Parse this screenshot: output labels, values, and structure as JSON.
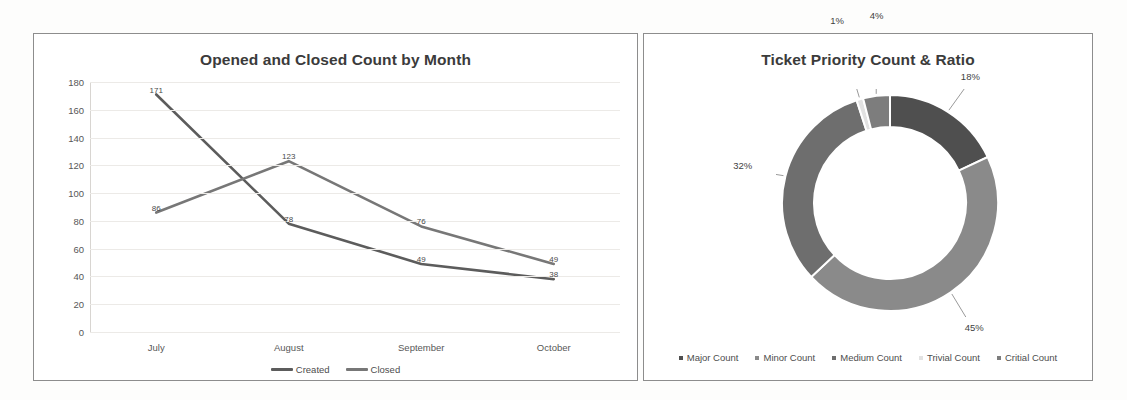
{
  "page": {
    "background": "#fdfdfc"
  },
  "line_panel": {
    "title": "Opened and Closed Count by Month",
    "legend": [
      {
        "label": "Created",
        "color": "#5c5c5c"
      },
      {
        "label": "Closed",
        "color": "#777777"
      }
    ]
  },
  "donut_panel": {
    "title": "Ticket Priority Count & Ratio",
    "legend": [
      {
        "label": "Major Count",
        "color": "#4f4f4f"
      },
      {
        "label": "Minor Count",
        "color": "#8a8a8a"
      },
      {
        "label": "Medium Count",
        "color": "#6e6e6e"
      },
      {
        "label": "Trivial Count",
        "color": "#e2e2e2"
      },
      {
        "label": "Critial Count",
        "color": "#7d7d7d"
      }
    ]
  },
  "chart_data": [
    {
      "type": "line",
      "title": "Opened and Closed Count by Month",
      "xlabel": "",
      "ylabel": "",
      "categories": [
        "July",
        "August",
        "September",
        "October"
      ],
      "yticks": [
        0,
        20,
        40,
        60,
        80,
        100,
        120,
        140,
        160,
        180
      ],
      "ylim": [
        0,
        180
      ],
      "grid": true,
      "legend_position": "bottom",
      "series": [
        {
          "name": "Created",
          "color": "#5c5c5c",
          "values": [
            171,
            78,
            49,
            38
          ],
          "labels": [
            "171",
            "78",
            "49",
            "38"
          ]
        },
        {
          "name": "Closed",
          "color": "#777777",
          "values": [
            86,
            123,
            76,
            49
          ],
          "labels": [
            "86",
            "123",
            "76",
            "49"
          ]
        }
      ]
    },
    {
      "type": "pie",
      "subtype": "donut",
      "title": "Ticket Priority Count & Ratio",
      "legend_position": "bottom",
      "labels": [
        "Major Count",
        "Minor Count",
        "Medium Count",
        "Trivial Count",
        "Critial Count"
      ],
      "values": [
        18,
        45,
        32,
        1,
        4
      ],
      "data_labels": [
        "18%",
        "45%",
        "32%",
        "1%",
        "4%"
      ],
      "colors": [
        "#4f4f4f",
        "#8a8a8a",
        "#6e6e6e",
        "#e2e2e2",
        "#7d7d7d"
      ]
    }
  ]
}
